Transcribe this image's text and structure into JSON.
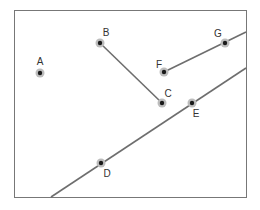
{
  "diagram": {
    "frame": {
      "x": 14,
      "y": 10,
      "width": 232,
      "height": 187,
      "stroke": "#777777"
    },
    "colors": {
      "line": "#6e6e6e",
      "point": "#1a1a1a",
      "halo": "#bdbdbd",
      "label": "#333333"
    },
    "points": [
      {
        "id": "A",
        "label": "A",
        "x": 40,
        "y": 73,
        "lx": 40,
        "ly": 65
      },
      {
        "id": "B",
        "label": "B",
        "x": 100,
        "y": 43,
        "lx": 106,
        "ly": 36
      },
      {
        "id": "C",
        "label": "C",
        "x": 162,
        "y": 103,
        "lx": 168,
        "ly": 97
      },
      {
        "id": "D",
        "label": "D",
        "x": 101,
        "y": 163,
        "lx": 107,
        "ly": 177
      },
      {
        "id": "E",
        "label": "E",
        "x": 192,
        "y": 103,
        "lx": 196,
        "ly": 117
      },
      {
        "id": "F",
        "label": "F",
        "x": 164,
        "y": 72,
        "lx": 159,
        "ly": 68
      },
      {
        "id": "G",
        "label": "G",
        "x": 225,
        "y": 43,
        "lx": 218,
        "ly": 37
      }
    ],
    "segments": [
      {
        "id": "BC",
        "from": "B",
        "to": "C",
        "x1": 100,
        "y1": 43,
        "x2": 162,
        "y2": 103
      },
      {
        "id": "FG-ray",
        "from": "F",
        "through": "G",
        "x1": 164,
        "y1": 72,
        "x2": 246,
        "y2": 32
      },
      {
        "id": "DE-line",
        "through": [
          "D",
          "E"
        ],
        "x1": 51,
        "y1": 197,
        "x2": 246,
        "y2": 68
      }
    ]
  }
}
